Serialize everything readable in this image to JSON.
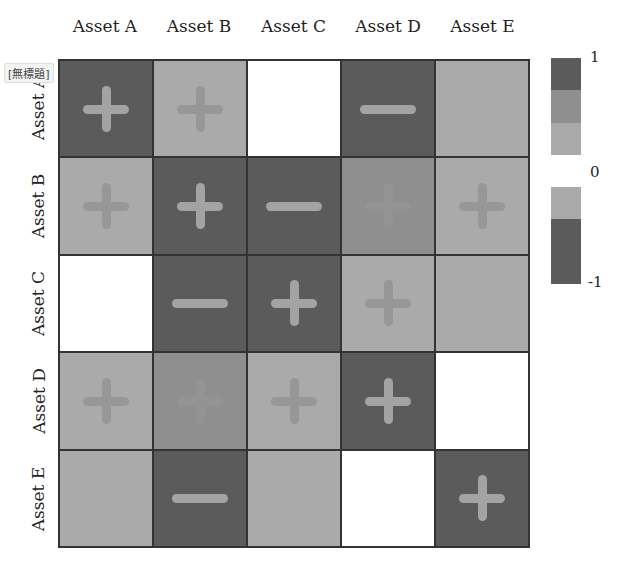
{
  "badge": {
    "text": "[無標題]"
  },
  "colors": {
    "dark": "#5b5b5b",
    "medium": "#8f8f8f",
    "light": "#aaaaaa",
    "white": "#ffffff",
    "symbol_on_dark": "#a3a3a3",
    "symbol_on_light": "#979797",
    "symbol_on_medium": "#939393"
  },
  "chart_data": {
    "type": "heatmap",
    "title": "",
    "x_labels": [
      "Asset A",
      "Asset B",
      "Asset C",
      "Asset D",
      "Asset E"
    ],
    "y_labels": [
      "Asset A",
      "Asset B",
      "Asset C",
      "Asset D",
      "Asset E"
    ],
    "colorbar": {
      "min": -1,
      "max": 1,
      "ticks": [
        "1",
        "0",
        "-1"
      ],
      "bands": [
        "dark",
        "medium",
        "light",
        "white",
        "light",
        "dark",
        "dark"
      ]
    },
    "cells": [
      [
        {
          "shade": "dark",
          "sign": "+"
        },
        {
          "shade": "light",
          "sign": "+"
        },
        {
          "shade": "white",
          "sign": ""
        },
        {
          "shade": "dark",
          "sign": "-"
        },
        {
          "shade": "light",
          "sign": ""
        }
      ],
      [
        {
          "shade": "light",
          "sign": "+"
        },
        {
          "shade": "dark",
          "sign": "+"
        },
        {
          "shade": "dark",
          "sign": "-"
        },
        {
          "shade": "medium",
          "sign": "+"
        },
        {
          "shade": "light",
          "sign": "+"
        }
      ],
      [
        {
          "shade": "white",
          "sign": ""
        },
        {
          "shade": "dark",
          "sign": "-"
        },
        {
          "shade": "dark",
          "sign": "+"
        },
        {
          "shade": "light",
          "sign": "+"
        },
        {
          "shade": "light",
          "sign": ""
        }
      ],
      [
        {
          "shade": "light",
          "sign": "+"
        },
        {
          "shade": "medium",
          "sign": "+"
        },
        {
          "shade": "light",
          "sign": "+"
        },
        {
          "shade": "dark",
          "sign": "+"
        },
        {
          "shade": "white",
          "sign": ""
        }
      ],
      [
        {
          "shade": "light",
          "sign": ""
        },
        {
          "shade": "dark",
          "sign": "-"
        },
        {
          "shade": "light",
          "sign": ""
        },
        {
          "shade": "white",
          "sign": ""
        },
        {
          "shade": "dark",
          "sign": "+"
        }
      ]
    ]
  }
}
